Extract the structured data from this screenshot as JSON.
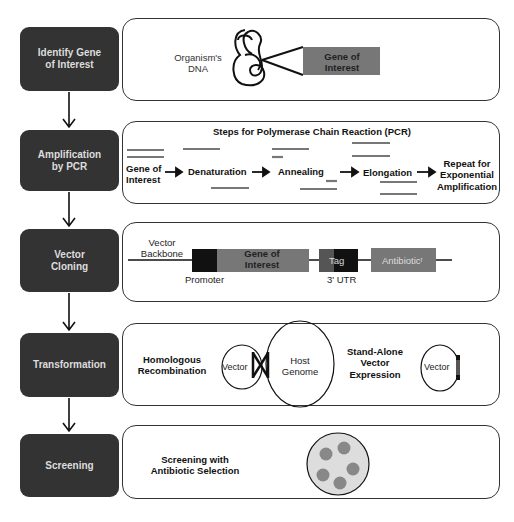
{
  "steps": [
    {
      "label": "Identify Gene of Interest"
    },
    {
      "label": "Amplification by PCR"
    },
    {
      "label": "Vector Cloning"
    },
    {
      "label": "Transformation"
    },
    {
      "label": "Screening"
    }
  ],
  "panel1": {
    "dna_label": "Organism's DNA",
    "gene_label": "Gene of Interest"
  },
  "panel2": {
    "title": "Steps for Polymerase Chain Reaction (PCR)",
    "stages": [
      "Gene of Interest",
      "Denaturation",
      "Annealing",
      "Elongation",
      "Repeat for Exponential Amplification"
    ]
  },
  "panel3": {
    "backbone": "Vector Backbone",
    "gene": "Gene of Interest",
    "promoter": "Promoter",
    "tag": "Tag",
    "utr": "3' UTR",
    "antibiotic": "Antibioticʳ"
  },
  "panel4": {
    "homologous": "Homologous Recombination",
    "vector1": "Vector",
    "host": "Host Genome",
    "standalone": "Stand-Alone Vector Expression",
    "vector2": "Vector"
  },
  "panel5": {
    "label": "Screening with Antibiotic Selection"
  }
}
